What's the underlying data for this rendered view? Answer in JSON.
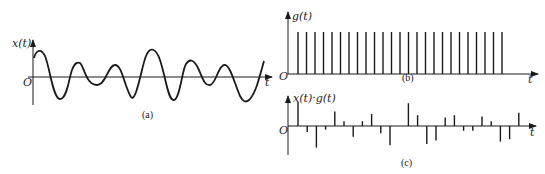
{
  "diagram": {
    "panel_a": {
      "y_label": "x(t)",
      "x_label": "t",
      "origin_label": "O",
      "caption": "(a)"
    },
    "panel_b": {
      "y_label": "g(t)",
      "x_label": "t",
      "origin_label": "O",
      "caption": "(b)",
      "impulse_count": 25
    },
    "panel_c": {
      "y_label": "x(t)·g(t)",
      "x_label": "t",
      "origin_label": "O",
      "caption": "(c)",
      "samples": [
        1.0,
        -0.25,
        -0.9,
        -0.15,
        0.6,
        0.2,
        -0.45,
        0.2,
        0.5,
        -0.3,
        -0.8,
        0.0,
        0.95,
        0.45,
        -0.75,
        -0.6,
        0.35,
        0.45,
        -0.2,
        -0.2,
        0.4,
        0.2,
        -0.65,
        -0.55,
        0.55
      ]
    }
  }
}
